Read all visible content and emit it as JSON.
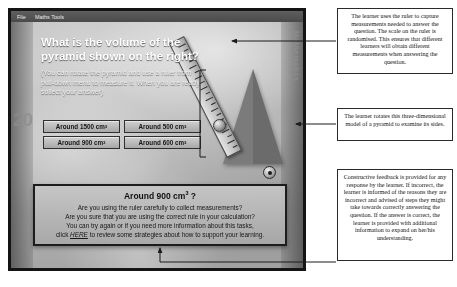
{
  "app": {
    "menubar": {
      "items": [
        {
          "label": "File"
        },
        {
          "label": "Maths Tools"
        }
      ]
    },
    "background_labels": {
      "left_number": "20",
      "right_text": "Mathematics"
    },
    "question": {
      "title": "What is the volume of the pyramid shown on the right?",
      "hint": "(You can rotate the pyramid and use a ruler from pull-down menu to measure it. When you are ready sollect your answer)"
    },
    "answers": [
      {
        "label": "Around 1500 cm",
        "exponent": "3"
      },
      {
        "label": "Around 500 cm",
        "exponent": "3"
      },
      {
        "label": "Around 900 cm",
        "exponent": "3"
      },
      {
        "label": "Around 600 cm",
        "exponent": "3"
      }
    ],
    "model": {
      "pyramid_name": "pyramid-model",
      "ruler_name": "ruler-tool",
      "knob_name": "ruler-drag-knob",
      "play_button_name": "rotate-play-button"
    },
    "feedback": {
      "heading": "Around 900 cm",
      "heading_exponent": "3",
      "heading_suffix": " ?",
      "line1": "Are you using the ruler carefully to collect measurements?",
      "line2": "Are you sure that you are using the correct rule in your calculation?",
      "line3": "You can try again or if you need more information about this tasks,",
      "line4_before": "click ",
      "link": "HERE",
      "line4_after": " to review some strategies about how to support your learning."
    }
  },
  "annotations": {
    "ruler_note": "The learner uses the ruler to capture measurements needed to answer the question. The scale on the ruler is randomised. This ensures that different learners will obtain different measurements when answering the question.",
    "model_note": "The learner rotates this three-dimensional model of a pyramid to examine its sides.",
    "feedback_note": "Constructive feedback is provided for any response by the learner. If incorrect, the learner is informed of the reasons they are incorrect and advised of steps they might take towards correctly answering the question. If the answer is correct, the learner is provided with additional information to expand on her/his understanding."
  },
  "colors": {
    "window_border": "#141414",
    "annotation_border": "#2a2a2a",
    "pyramid_fill": "#7b7b7b",
    "menubar": "#4a4a4a"
  }
}
